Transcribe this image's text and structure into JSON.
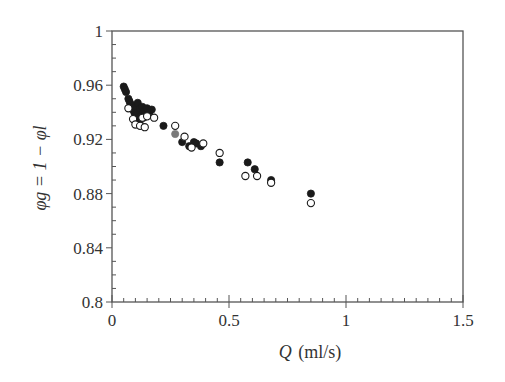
{
  "chart_data": {
    "type": "scatter",
    "title": "",
    "xlabel": "Q (ml/s)",
    "ylabel": "φg = 1 − φl",
    "xlim": [
      0,
      1.5
    ],
    "ylim": [
      0.8,
      1.0
    ],
    "x_ticks": [
      0,
      0.5,
      1,
      1.5
    ],
    "x_tick_labels": [
      "0",
      "0.5",
      "1",
      "1.5"
    ],
    "y_ticks": [
      0.8,
      0.84,
      0.88,
      0.92,
      0.96,
      1.0
    ],
    "y_tick_labels": [
      "0.8",
      "0.84",
      "0.88",
      "0.92",
      "0.96",
      "1"
    ],
    "grid": false,
    "legend": null,
    "series": [
      {
        "name": "filled",
        "marker": "filled-circle",
        "color": "#1a1a1a",
        "points": [
          [
            0.05,
            0.959
          ],
          [
            0.055,
            0.957
          ],
          [
            0.06,
            0.955
          ],
          [
            0.07,
            0.95
          ],
          [
            0.075,
            0.948
          ],
          [
            0.08,
            0.946
          ],
          [
            0.085,
            0.944
          ],
          [
            0.09,
            0.942
          ],
          [
            0.095,
            0.94
          ],
          [
            0.1,
            0.945
          ],
          [
            0.1,
            0.938
          ],
          [
            0.105,
            0.936
          ],
          [
            0.11,
            0.947
          ],
          [
            0.11,
            0.94
          ],
          [
            0.115,
            0.934
          ],
          [
            0.12,
            0.943
          ],
          [
            0.12,
            0.931
          ],
          [
            0.125,
            0.938
          ],
          [
            0.13,
            0.944
          ],
          [
            0.135,
            0.936
          ],
          [
            0.14,
            0.941
          ],
          [
            0.15,
            0.943
          ],
          [
            0.16,
            0.94
          ],
          [
            0.17,
            0.942
          ],
          [
            0.22,
            0.93
          ],
          [
            0.3,
            0.918
          ],
          [
            0.33,
            0.915
          ],
          [
            0.35,
            0.918
          ],
          [
            0.36,
            0.917
          ],
          [
            0.38,
            0.915
          ],
          [
            0.46,
            0.903
          ],
          [
            0.58,
            0.903
          ],
          [
            0.61,
            0.898
          ],
          [
            0.68,
            0.89
          ],
          [
            0.85,
            0.88
          ]
        ]
      },
      {
        "name": "open",
        "marker": "open-circle",
        "color": "#1a1a1a",
        "points": [
          [
            0.07,
            0.943
          ],
          [
            0.09,
            0.935
          ],
          [
            0.1,
            0.931
          ],
          [
            0.12,
            0.93
          ],
          [
            0.13,
            0.936
          ],
          [
            0.14,
            0.929
          ],
          [
            0.15,
            0.937
          ],
          [
            0.18,
            0.936
          ],
          [
            0.27,
            0.93
          ],
          [
            0.31,
            0.922
          ],
          [
            0.34,
            0.914
          ],
          [
            0.39,
            0.917
          ],
          [
            0.46,
            0.91
          ],
          [
            0.57,
            0.893
          ],
          [
            0.62,
            0.893
          ],
          [
            0.68,
            0.888
          ],
          [
            0.85,
            0.873
          ]
        ]
      },
      {
        "name": "gray",
        "marker": "filled-circle",
        "color": "#7a7a7a",
        "points": [
          [
            0.27,
            0.924
          ]
        ]
      }
    ]
  },
  "axes": {
    "x_title_symbol": "Q",
    "x_title_unit": "(ml/s)",
    "y_title": "φg = 1 − φl"
  }
}
